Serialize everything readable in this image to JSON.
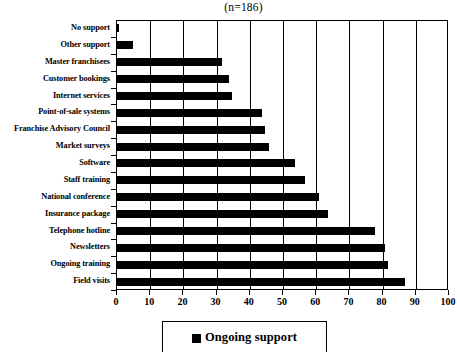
{
  "chart": {
    "title": "(n=186)",
    "legend_label": "Ongoing support",
    "legend_swatch_color": "#000000",
    "bar_color": "#000000",
    "axis_color": "#000000"
  },
  "chart_data": {
    "type": "bar",
    "orientation": "horizontal",
    "title": "(n=186)",
    "xlabel": "",
    "ylabel": "",
    "xlim": [
      0,
      100
    ],
    "xticks": [
      0,
      10,
      20,
      30,
      40,
      50,
      60,
      70,
      80,
      90,
      100
    ],
    "grid": true,
    "legend_position": "bottom",
    "series": [
      {
        "name": "Ongoing support",
        "color": "#000000",
        "values": [
          1,
          5,
          32,
          34,
          35,
          44,
          45,
          46,
          54,
          57,
          61,
          64,
          78,
          81,
          82,
          87
        ]
      }
    ],
    "categories": [
      "No support",
      "Other support",
      "Master franchisees",
      "Customer bookings",
      "Internet services",
      "Point-of-sale systems",
      "Franchise Advisory Council",
      "Market surveys",
      "Software",
      "Staff training",
      "National conference",
      "Insurance package",
      "Telephone hotline",
      "Newsletters",
      "Ongoing training",
      "Field visits"
    ]
  }
}
